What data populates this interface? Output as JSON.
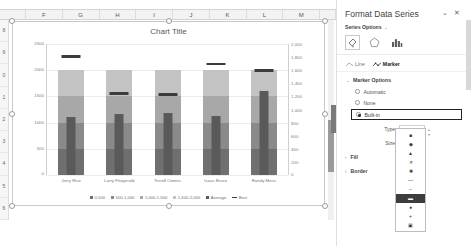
{
  "sheet": {
    "column_headers": [
      "F",
      "G",
      "H",
      "I",
      "J",
      "K",
      "L",
      "M"
    ],
    "row_headers": [
      "8",
      "9",
      "0",
      "1",
      "2",
      "3",
      "4",
      "5",
      "6"
    ]
  },
  "chart": {
    "title": "Chart Title",
    "left_axis_ticks": [
      "2500",
      "2000",
      "1500",
      "1000",
      "500",
      "0"
    ],
    "right_axis_ticks": [
      "2,000",
      "1,800",
      "1,600",
      "1,400",
      "1,200",
      "1,000",
      "800",
      "600",
      "400",
      "200",
      "0"
    ],
    "legend": [
      {
        "label": "0-500",
        "color": "#6f6f6f",
        "type": "swatch"
      },
      {
        "label": "500-1,000",
        "color": "#8a8a8a",
        "type": "swatch"
      },
      {
        "label": "1,000-1,500",
        "color": "#a8a8a8",
        "type": "swatch"
      },
      {
        "label": "1,500-2,000",
        "color": "#c3c3c3",
        "type": "swatch"
      },
      {
        "label": "Average",
        "color": "#5a5a5a",
        "type": "swatch"
      },
      {
        "label": "Best",
        "color": "#3c3c3c",
        "type": "line"
      }
    ]
  },
  "chart_data": {
    "type": "bar",
    "title": "Chart Title",
    "xlabel": "",
    "ylabel": "",
    "ylim": [
      0,
      2500
    ],
    "y2lim": [
      0,
      2000
    ],
    "grid": true,
    "legend_position": "bottom",
    "categories": [
      "Jerry Rice",
      "Larry Fitzgerald",
      "Terrell Owens",
      "Isaac Bruce",
      "Randy Moss"
    ],
    "bands": [
      500,
      500,
      500,
      500
    ],
    "band_names": [
      "0-500",
      "500-1,000",
      "1,000-1,500",
      "1,500-2,000"
    ],
    "series": [
      {
        "name": "Range total",
        "values": [
          2000,
          2000,
          2000,
          2000,
          2000
        ]
      },
      {
        "name": "Average",
        "values": [
          1100,
          1170,
          1180,
          1120,
          1600
        ]
      },
      {
        "name": "Best",
        "values": [
          2260,
          1560,
          1540,
          2120,
          1990
        ]
      }
    ]
  },
  "pane": {
    "title": "Format Data Series",
    "collapse_label": "⌄",
    "close_label": "✕",
    "series_options_label": "Series Options",
    "chevron": "⌄",
    "icons": [
      {
        "name": "fill-line-icon",
        "glyph": "◩"
      },
      {
        "name": "effects-icon",
        "glyph": "⬠"
      },
      {
        "name": "series-options-icon",
        "glyph": "█"
      }
    ],
    "tabs": [
      {
        "label": "Line",
        "active": false
      },
      {
        "label": "Marker",
        "active": true
      }
    ],
    "marker_options_label": "Marker Options",
    "marker_mode": [
      {
        "label": "Automatic",
        "selected": false
      },
      {
        "label": "None",
        "selected": false
      },
      {
        "label": "Built-in",
        "selected": true
      }
    ],
    "type_label": "Type",
    "type_value": "—",
    "size_label": "Size",
    "size_value": "",
    "fill_label": "Fill",
    "border_label": "Border",
    "expand_arrow": "›",
    "marker_type_options": [
      "■",
      "◆",
      "▲",
      "✕",
      "✱",
      "—",
      "–",
      "▬",
      "●",
      "+",
      "▣"
    ],
    "marker_type_selected_index": 7,
    "dropdown_up": "▴",
    "dropdown_down": "▾"
  }
}
